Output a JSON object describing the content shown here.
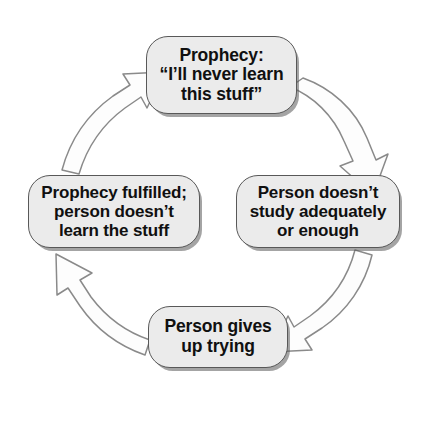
{
  "diagram": {
    "type": "cycle-diagram",
    "background_color": "#ffffff",
    "node_fill_color": "#ebebeb",
    "node_border_color": "#585858",
    "arrow_stroke_color": "#8a8a8a",
    "arrow_fill_color": "#fdfdfd",
    "text_color": "#101010",
    "nodes": [
      {
        "id": "prophecy",
        "label": "Prophecy:\n“I’ll never learn\nthis stuff”",
        "position": "top"
      },
      {
        "id": "study",
        "label": "Person doesn’t\nstudy adequately\nor enough",
        "position": "right"
      },
      {
        "id": "gives-up",
        "label": "Person gives\nup trying",
        "position": "bottom"
      },
      {
        "id": "fulfilled",
        "label": "Prophecy fulfilled;\nperson doesn’t\nlearn the stuff",
        "position": "left"
      }
    ],
    "arrows": [
      {
        "id": "prophecy-to-study",
        "from": "prophecy",
        "to": "study",
        "direction": "clockwise"
      },
      {
        "id": "study-to-gives-up",
        "from": "study",
        "to": "gives-up",
        "direction": "clockwise"
      },
      {
        "id": "gives-up-to-fulfilled",
        "from": "gives-up",
        "to": "fulfilled",
        "direction": "clockwise"
      },
      {
        "id": "fulfilled-to-prophecy",
        "from": "fulfilled",
        "to": "prophecy",
        "direction": "clockwise"
      }
    ]
  }
}
